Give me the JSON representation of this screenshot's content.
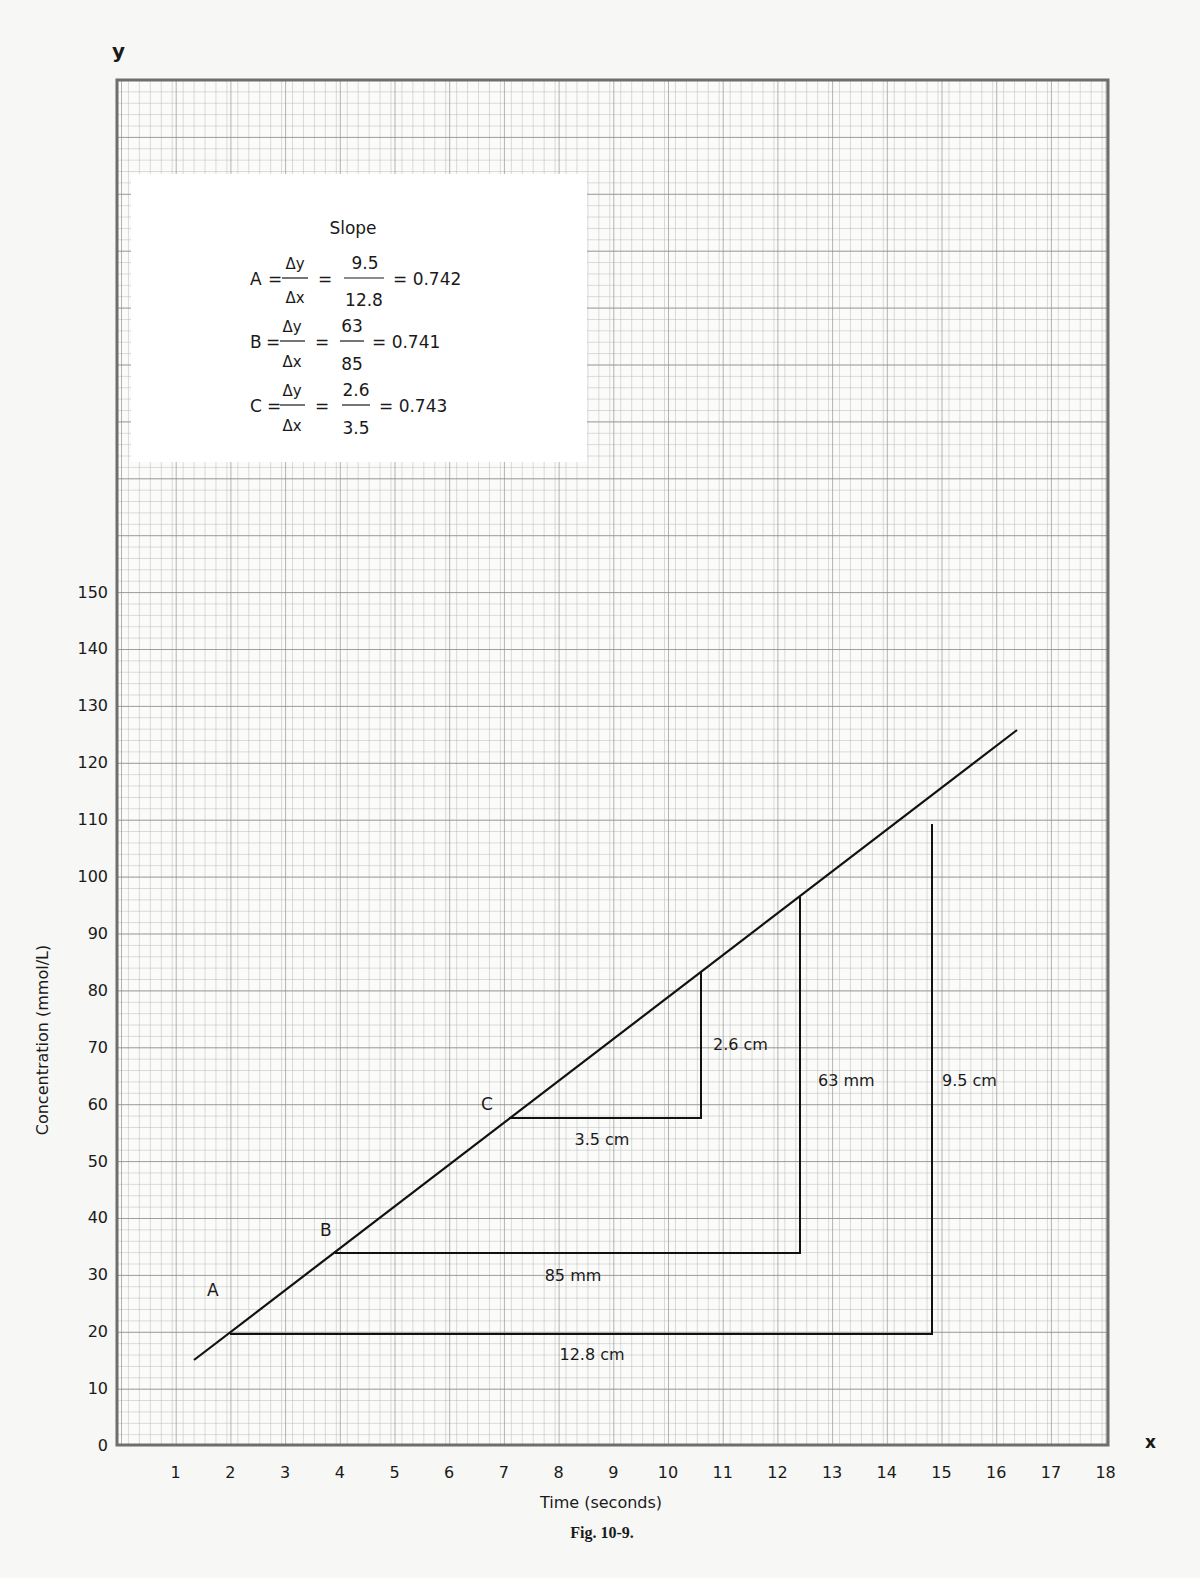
{
  "figure": {
    "caption": "Fig. 10-9.",
    "axis_letter_y": "y",
    "axis_letter_x": "x"
  },
  "slope_box": {
    "title": "Slope",
    "rows": [
      {
        "label": "A",
        "dy": "Δy",
        "dx": "Δx",
        "num": "9.5",
        "den": "12.8",
        "result": "= 0.742"
      },
      {
        "label": "B",
        "dy": "Δy",
        "dx": "Δx",
        "num": "63",
        "den": "85",
        "result": "= 0.741"
      },
      {
        "label": "C",
        "dy": "Δy",
        "dx": "Δx",
        "num": "2.6",
        "den": "3.5",
        "result": "= 0.743"
      }
    ]
  },
  "annotations": {
    "point_a": "A",
    "point_b": "B",
    "point_c": "C",
    "a_dx": "12.8 cm",
    "a_dy": "9.5 cm",
    "b_dx": "85 mm",
    "b_dy": "63 mm",
    "c_dx": "3.5 cm",
    "c_dy": "2.6 cm"
  },
  "colors": {
    "paper": "#f7f7f5",
    "grid_minor": "#b8b8b8",
    "grid_major": "#8c8c8c",
    "ink": "#1a1a1a"
  },
  "chart_data": {
    "type": "line",
    "title": "",
    "xlabel": "Time (seconds)",
    "ylabel": "Concentration (mmol/L)",
    "x_ticks": [
      "1",
      "2",
      "3",
      "4",
      "5",
      "6",
      "7",
      "8",
      "9",
      "10",
      "11",
      "12",
      "13",
      "14",
      "15",
      "16",
      "17",
      "18"
    ],
    "y_ticks": [
      "0",
      "10",
      "20",
      "30",
      "40",
      "50",
      "60",
      "70",
      "80",
      "90",
      "100",
      "110",
      "120",
      "130",
      "140",
      "150"
    ],
    "xlim": [
      0,
      18
    ],
    "ylim": [
      0,
      150
    ],
    "grid": true,
    "legend": null,
    "series": [
      {
        "name": "line",
        "x": [
          1.3,
          16.4
        ],
        "y": [
          15,
          126
        ]
      }
    ],
    "slope_triangles": [
      {
        "name": "A",
        "start": [
          2.0,
          20
        ],
        "corner": [
          14.8,
          20
        ],
        "end": [
          14.8,
          114
        ],
        "dx_label": "12.8 cm",
        "dy_label": "9.5 cm",
        "slope": 0.742
      },
      {
        "name": "B",
        "start": [
          3.9,
          34
        ],
        "corner": [
          12.4,
          34
        ],
        "end": [
          12.4,
          96
        ],
        "dx_label": "85 mm",
        "dy_label": "63 mm",
        "slope": 0.741
      },
      {
        "name": "C",
        "start": [
          7.1,
          58
        ],
        "corner": [
          10.6,
          58
        ],
        "end": [
          10.6,
          83
        ],
        "dx_label": "3.5 cm",
        "dy_label": "2.6 cm",
        "slope": 0.743
      }
    ]
  }
}
